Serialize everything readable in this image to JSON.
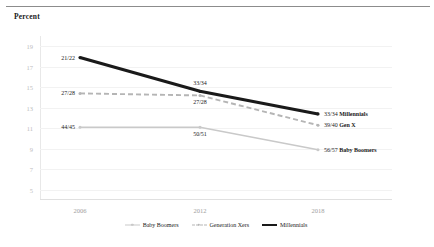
{
  "axis_title": "Percent",
  "colors": {
    "millennials": "#1a1a1a",
    "genx": "#b5b5b5",
    "boomers": "#c9c9c9",
    "gridline": "#f2f2f2",
    "ytick": "#bdbdbd",
    "xtick": "#9e9e9e"
  },
  "legend": {
    "items": [
      {
        "label": "Baby Boomers",
        "style": "solid-marker",
        "color": "#c9c9c9"
      },
      {
        "label": "Generation Xers",
        "style": "dashed-marker",
        "color": "#b5b5b5"
      },
      {
        "label": "Millennials",
        "style": "thick-solid",
        "color": "#1a1a1a"
      }
    ]
  },
  "chart_data": {
    "type": "line",
    "title": "",
    "subtitle": "",
    "xlabel": "",
    "ylabel": "Percent",
    "x": [
      "2006",
      "2012",
      "2018"
    ],
    "xticklabels": [
      "2006",
      "2012",
      "2018"
    ],
    "yticklabels": [
      "19",
      "17",
      "15",
      "13",
      "11",
      "9",
      "7",
      "5"
    ],
    "yticks": [
      19,
      17,
      15,
      13,
      11,
      9,
      7,
      5
    ],
    "ylim": [
      4,
      20
    ],
    "grid": true,
    "legend_position": "bottom",
    "series": [
      {
        "name": "Millennials",
        "values": [
          17.9,
          14.6,
          12.4
        ],
        "point_labels": [
          "21/22",
          "33/34",
          "33/34"
        ],
        "end_label": "33/34 Millennials"
      },
      {
        "name": "Generation Xers",
        "values": [
          14.4,
          14.2,
          11.3
        ],
        "point_labels": [
          "27/28",
          "27/28",
          "39/40"
        ],
        "end_label": "39/40 Gen X"
      },
      {
        "name": "Baby Boomers",
        "values": [
          11.1,
          11.1,
          8.9
        ],
        "point_labels": [
          "44/45",
          "50/51",
          "56/57"
        ],
        "end_label": "56/57 Baby Boomers"
      }
    ],
    "annotations": [
      {
        "text": "21/22",
        "series": "Millennials",
        "x": "2006",
        "anchor": "left"
      },
      {
        "text": "33/34",
        "series": "Millennials",
        "x": "2012",
        "anchor": "above"
      },
      {
        "text": "33/34",
        "bold_suffix": "Millennials",
        "series": "Millennials",
        "x": "2018",
        "anchor": "right"
      },
      {
        "text": "27/28",
        "series": "Generation Xers",
        "x": "2006",
        "anchor": "left"
      },
      {
        "text": "27/28",
        "series": "Generation Xers",
        "x": "2012",
        "anchor": "below"
      },
      {
        "text": "39/40",
        "bold_suffix": "Gen X",
        "series": "Generation Xers",
        "x": "2018",
        "anchor": "right"
      },
      {
        "text": "44/45",
        "series": "Baby Boomers",
        "x": "2006",
        "anchor": "left"
      },
      {
        "text": "50/51",
        "series": "Baby Boomers",
        "x": "2012",
        "anchor": "below"
      },
      {
        "text": "56/57",
        "bold_suffix": "Baby Boomers",
        "series": "Baby Boomers",
        "x": "2018",
        "anchor": "right"
      }
    ]
  }
}
